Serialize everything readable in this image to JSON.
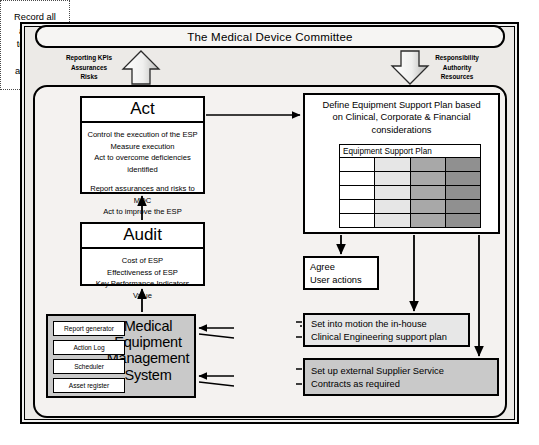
{
  "diagram": {
    "title": "The Medical Device Committee",
    "committee_bar_label": "The Medical Device Committee"
  },
  "flows": {
    "up_arrow_label": "Reporting KPIs\nAssurances\nRisks",
    "up_arrow_lines": [
      "Reporting KPIs",
      "Assurances",
      "Risks"
    ],
    "down_arrow_label": "Responsibility\nAuthority\nResources",
    "down_arrow_lines": [
      "Responsibility",
      "Authority",
      "Resources"
    ]
  },
  "act": {
    "title": "Act",
    "lines_group_1": [
      "Control the execution of the ESP",
      "Measure execution",
      "Act to overcome deficiencies identified"
    ],
    "lines_group_2": [
      "Report assurances and risks to MDC",
      "Act to improve the ESP"
    ]
  },
  "audit": {
    "title": "Audit",
    "lines": [
      "Cost of ESP",
      "Effectiveness of ESP",
      "Key Performance Indicators",
      "Value"
    ]
  },
  "define_plan": {
    "heading_lines": [
      "Define Equipment Support Plan based",
      "on Clinical, Corporate & Financial",
      "considerations"
    ],
    "table": {
      "header": "Equipment Support Plan",
      "column_count": 4,
      "row_count": 5,
      "column_shades": [
        "#ffffff",
        "#e6e6e6",
        "#a8a8a8",
        "#909090"
      ]
    }
  },
  "agree": {
    "lines": [
      "Agree",
      "User actions"
    ]
  },
  "mems": {
    "title_lines": [
      "Medical",
      "Equipment",
      "Management",
      "System"
    ],
    "modules": [
      "Report generator",
      "Action Log",
      "Scheduler",
      "Asset register"
    ]
  },
  "record": {
    "lines": [
      "Record all",
      "actions,",
      "technical",
      "data",
      "and costs"
    ]
  },
  "inhouse": {
    "lines": [
      "Set into motion the in-house",
      "Clinical Engineering support plan"
    ]
  },
  "supplier": {
    "lines": [
      "Set up external Supplier Service",
      "Contracts as required"
    ]
  },
  "colors": {
    "frame_background": "#f2f2f1",
    "mems_fill": "#c9c9c9",
    "inhouse_fill": "#e7e7e7",
    "supplier_fill": "#c9c9c9",
    "stroke": "#000000"
  }
}
